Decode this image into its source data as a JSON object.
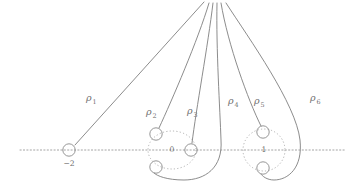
{
  "figure": {
    "background_color": "#ffffff",
    "stroke_color": "#7f7f7f",
    "dotted_color": "#a8a8a8",
    "label_color": "#6e6e6e",
    "width": 358,
    "height": 187,
    "basepoint": {
      "x": 213,
      "y": 2,
      "name": "basepoint"
    }
  },
  "axis": {
    "name": "real-axis",
    "y": 150,
    "x_start": 20,
    "x_end": 346,
    "style": "dotted"
  },
  "loop_labels": [
    {
      "id": "rho1",
      "symbol": "ρ",
      "subscript": "1",
      "x": 86,
      "y": 101
    },
    {
      "id": "rho2",
      "symbol": "ρ",
      "subscript": "2",
      "x": 146,
      "y": 115
    },
    {
      "id": "rho3",
      "symbol": "ρ",
      "subscript": "3",
      "x": 187,
      "y": 114
    },
    {
      "id": "rho4",
      "symbol": "ρ",
      "subscript": "4",
      "x": 228,
      "y": 104
    },
    {
      "id": "rho5",
      "symbol": "ρ",
      "subscript": "5",
      "x": 254,
      "y": 104
    },
    {
      "id": "rho6",
      "symbol": "ρ",
      "subscript": "6",
      "x": 310,
      "y": 101
    }
  ],
  "point_labels": [
    {
      "id": "point-minus-two",
      "text": "−2",
      "x": 69,
      "y": 166,
      "anchor": "middle"
    },
    {
      "id": "point-zero",
      "text": "0",
      "x": 172,
      "y": 152,
      "anchor": "middle"
    },
    {
      "id": "point-one",
      "text": "1",
      "x": 264,
      "y": 152,
      "anchor": "middle"
    }
  ],
  "branch_groups": [
    {
      "id": "group-zero",
      "center_label": "0",
      "ellipse": {
        "cx": 172,
        "cy": 150,
        "rx": 24,
        "ry": 19
      }
    },
    {
      "id": "group-one",
      "center_label": "1",
      "ellipse": {
        "cx": 264,
        "cy": 150,
        "rx": 21,
        "ry": 21
      }
    }
  ],
  "nodes": [
    {
      "id": "node-minus-two",
      "cx": 69,
      "cy": 150,
      "r": 6.2
    },
    {
      "id": "node-zero-upper",
      "cx": 156,
      "cy": 134,
      "r": 6.2
    },
    {
      "id": "node-zero-lower",
      "cx": 156,
      "cy": 167,
      "r": 6.2
    },
    {
      "id": "node-zero-right",
      "cx": 191,
      "cy": 150,
      "r": 6.2
    },
    {
      "id": "node-one-upper",
      "cx": 263,
      "cy": 132,
      "r": 6.2
    },
    {
      "id": "node-one-lower",
      "cx": 263,
      "cy": 168,
      "r": 6.2
    }
  ],
  "curves": [
    {
      "id": "curve-rho1",
      "label": "ρ₁",
      "d": "M 204 2 L 75 145"
    },
    {
      "id": "curve-rho2",
      "label": "ρ₂",
      "d": "M 209 3 C 198 40 172 100 159 128"
    },
    {
      "id": "curve-rho3",
      "label": "ρ₃",
      "d": "M 213 3 C 208 45 196 110 192 143"
    },
    {
      "id": "curve-rho4",
      "label": "ρ₄",
      "d": "M 217 3 C 216 48 220 110 221 140 C 223 168 205 180 184 180 C 167 180 157 176 154 173"
    },
    {
      "id": "curve-rho5",
      "label": "ρ₅",
      "d": "M 221 3 C 228 45 248 100 261 126"
    },
    {
      "id": "curve-rho6",
      "label": "ρ₆",
      "d": "M 226 3 C 250 40 296 104 300 140 C 303 168 288 180 274 180 C 267 180 262 176 261 174"
    }
  ],
  "caption": {
    "description": "Six loops ρ₁…ρ₆ based at a common point encircling branch points at −2, 0 and 1"
  }
}
